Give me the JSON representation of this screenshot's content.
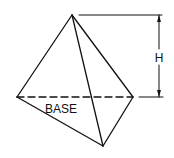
{
  "diagram": {
    "type": "tetrahedron-height-diagram",
    "labels": {
      "height": "H",
      "base": "BASE"
    },
    "vertices": {
      "apex": [
        72,
        15
      ],
      "left": [
        17,
        97
      ],
      "right": [
        133,
        97
      ],
      "front": [
        103,
        146
      ]
    },
    "colors": {
      "stroke": "#111111",
      "background": "#ffffff"
    }
  }
}
